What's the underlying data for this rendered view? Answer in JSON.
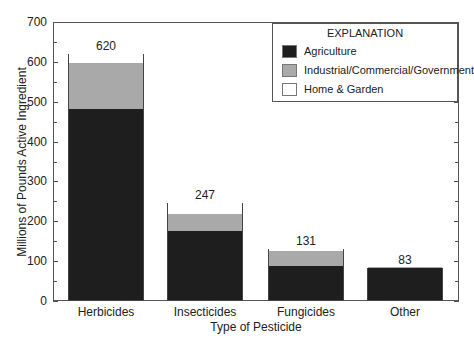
{
  "chart_data": {
    "type": "bar",
    "stacked": true,
    "title": "",
    "xlabel": "Type of Pesticide",
    "ylabel": "Millions of Pounds Active Ingredient",
    "ylim": [
      0,
      700
    ],
    "yticks": [
      0,
      100,
      200,
      300,
      400,
      500,
      600,
      700
    ],
    "grid": false,
    "legend_position": "upper right",
    "legend_title": "EXPLANATION",
    "categories": [
      "Herbicides",
      "Insecticides",
      "Fungicides",
      "Other"
    ],
    "series": [
      {
        "name": "Agriculture",
        "color": "#1e1e1e",
        "values": [
          480,
          172,
          86,
          80
        ]
      },
      {
        "name": "Industrial/Commercial/Government",
        "color": "#a9a9a9",
        "values": [
          115,
          45,
          37,
          3
        ]
      },
      {
        "name": "Home & Garden",
        "color": "#ffffff",
        "values": [
          25,
          30,
          8,
          0
        ]
      }
    ],
    "totals": [
      620,
      247,
      131,
      83
    ],
    "total_labels": [
      "620",
      "247",
      "131",
      "83"
    ]
  },
  "axis": {
    "y_tick_labels": [
      "0",
      "100",
      "200",
      "300",
      "400",
      "500",
      "600",
      "700"
    ]
  },
  "legend": {
    "title": "EXPLANATION",
    "items": [
      {
        "label": "Agriculture"
      },
      {
        "label": "Industrial/Commercial/Government"
      },
      {
        "label": "Home & Garden"
      }
    ]
  }
}
